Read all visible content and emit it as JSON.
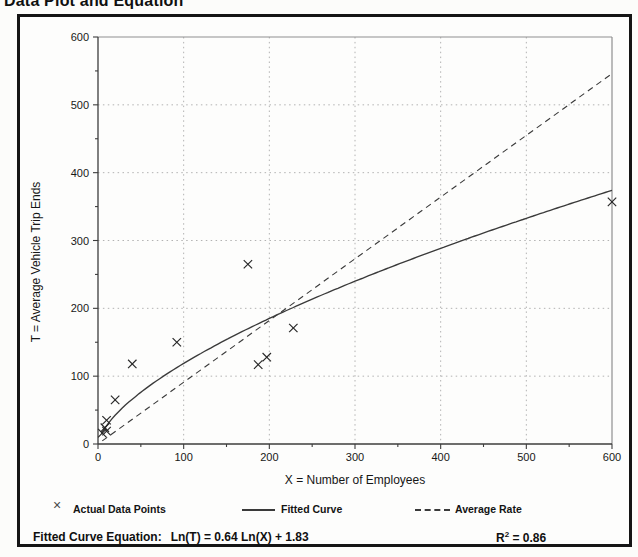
{
  "title": "Data Plot and Equation",
  "legend": {
    "marker_symbol": "×",
    "actual_label": "Actual Data Points",
    "fitted_label": "Fitted Curve",
    "average_label": "Average Rate"
  },
  "equation": {
    "label": "Fitted Curve Equation:",
    "formula": "Ln(T) = 0.64 Ln(X) + 1.83",
    "r_prefix": "R",
    "r_sup": "2",
    "r_rest": " = 0.86"
  },
  "chart_data": {
    "type": "scatter",
    "title": "Data Plot and Equation",
    "xlabel": "X = Number of Employees",
    "ylabel": "T = Average Vehicle Trip Ends",
    "xlim": [
      0,
      600
    ],
    "ylim": [
      0,
      600
    ],
    "x_ticks": [
      0,
      100,
      200,
      300,
      400,
      500,
      600
    ],
    "y_ticks": [
      0,
      100,
      200,
      300,
      400,
      500,
      600
    ],
    "minor_tick_step": 50,
    "grid_lines": [
      100,
      200,
      300,
      400,
      500
    ],
    "grid_style": "dotted",
    "legend_position": "bottom",
    "series": [
      {
        "name": "Actual Data Points",
        "type": "scatter",
        "marker": "x",
        "points": [
          [
            5,
            16
          ],
          [
            8,
            24
          ],
          [
            10,
            19
          ],
          [
            10,
            35
          ],
          [
            20,
            65
          ],
          [
            40,
            118
          ],
          [
            92,
            150
          ],
          [
            175,
            265
          ],
          [
            187,
            117
          ],
          [
            197,
            128
          ],
          [
            228,
            171
          ],
          [
            600,
            357
          ]
        ]
      },
      {
        "name": "Fitted Curve",
        "type": "line",
        "model": "log-log power fit",
        "ln_coef": 0.64,
        "ln_intercept": 1.83,
        "x_range": [
          4,
          600
        ]
      },
      {
        "name": "Average Rate",
        "type": "line",
        "style": "dashed",
        "rate": 0.91,
        "x_range": [
          5,
          600
        ]
      }
    ],
    "fitted_equation": "Ln(T) = 0.64 Ln(X) + 1.83",
    "r_squared": 0.86
  }
}
